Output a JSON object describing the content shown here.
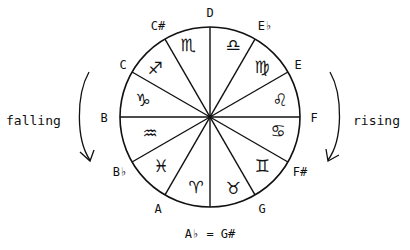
{
  "diagram": {
    "center": {
      "x": 210,
      "y": 117
    },
    "radius": 90,
    "note_labels": [
      {
        "text": "D",
        "x": 210,
        "y": 17
      },
      {
        "text": "E♭",
        "x": 263,
        "y": 30
      },
      {
        "text": "E",
        "x": 298,
        "y": 69
      },
      {
        "text": "F",
        "x": 314,
        "y": 122
      },
      {
        "text": "F#",
        "x": 298,
        "y": 175
      },
      {
        "text": "G",
        "x": 262,
        "y": 213
      },
      {
        "text": "A",
        "x": 158,
        "y": 213
      },
      {
        "text": "B♭",
        "x": 121,
        "y": 175
      },
      {
        "text": "B",
        "x": 104,
        "y": 122
      },
      {
        "text": "C",
        "x": 123,
        "y": 69
      },
      {
        "text": "C#",
        "x": 158,
        "y": 30
      }
    ],
    "bottom_label": "A♭ = G#",
    "zodiac": [
      {
        "name": "libra",
        "glyph": "♎",
        "x": 233,
        "y": 50
      },
      {
        "name": "virgo",
        "glyph": "♍",
        "x": 262,
        "y": 67
      },
      {
        "name": "leo",
        "glyph": "♌",
        "x": 279,
        "y": 100
      },
      {
        "name": "cancer",
        "glyph": "♋",
        "x": 279,
        "y": 137
      },
      {
        "name": "gemini",
        "glyph": "♊",
        "x": 262,
        "y": 172
      },
      {
        "name": "taurus",
        "glyph": "♉",
        "x": 233,
        "y": 192
      },
      {
        "name": "aries",
        "glyph": "♈",
        "x": 188,
        "y": 192
      },
      {
        "name": "pisces",
        "glyph": "♓",
        "x": 159,
        "y": 172
      },
      {
        "name": "aquarius",
        "glyph": "♒",
        "x": 143,
        "y": 137
      },
      {
        "name": "capricorn",
        "glyph": "♑",
        "x": 143,
        "y": 100
      },
      {
        "name": "sagittarius",
        "glyph": "♐",
        "x": 159,
        "y": 67
      },
      {
        "name": "scorpio",
        "glyph": "♏",
        "x": 188,
        "y": 50
      }
    ],
    "left_word": "falling",
    "right_word": "rising"
  }
}
